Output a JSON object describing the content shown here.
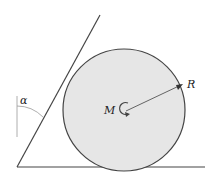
{
  "diagram": {
    "labels": {
      "moment": "M",
      "radius": "R",
      "angle": "α"
    },
    "colors": {
      "disk_fill": "#e6e6e6",
      "stroke": "#333333",
      "thin_stroke": "#888888"
    }
  }
}
